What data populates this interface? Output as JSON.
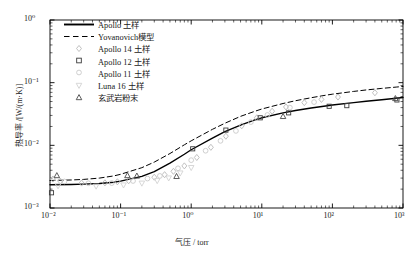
{
  "chart_data": {
    "type": "line",
    "title": "",
    "subtitle": "",
    "xlabel": "气压 / torr",
    "ylabel": "热导率 /[W/(m·K)]",
    "xscale": "log",
    "yscale": "log",
    "xlim": [
      0.01,
      1000
    ],
    "ylim": [
      0.001,
      1
    ],
    "grid": false,
    "legend_position": "upper-left-inside",
    "xticklabels": [
      "10⁻²",
      "10⁻¹",
      "10⁰",
      "10¹",
      "10²",
      "10³"
    ],
    "xtickvalues": [
      0.01,
      0.1,
      1,
      10,
      100,
      1000
    ],
    "yticklabels": [
      "10⁰",
      "10⁻¹",
      "10⁻²",
      "10⁻³"
    ],
    "ytickvalues": [
      1,
      0.1,
      0.01,
      0.001
    ],
    "series": [
      {
        "name": "Apollo 土样",
        "kind": "line",
        "style": "solid",
        "color": "#000000",
        "marker": "none",
        "points": [
          [
            0.01,
            0.00235
          ],
          [
            0.02,
            0.00237
          ],
          [
            0.03,
            0.0024
          ],
          [
            0.05,
            0.00246
          ],
          [
            0.08,
            0.00258
          ],
          [
            0.1,
            0.00268
          ],
          [
            0.2,
            0.0032
          ],
          [
            0.3,
            0.0038
          ],
          [
            0.5,
            0.0052
          ],
          [
            0.8,
            0.0072
          ],
          [
            1.0,
            0.0085
          ],
          [
            2.0,
            0.013
          ],
          [
            3.0,
            0.0165
          ],
          [
            5.0,
            0.021
          ],
          [
            8.0,
            0.0255
          ],
          [
            10.0,
            0.0275
          ],
          [
            20.0,
            0.033
          ],
          [
            30.0,
            0.036
          ],
          [
            50.0,
            0.0395
          ],
          [
            80.0,
            0.0425
          ],
          [
            100.0,
            0.044
          ],
          [
            200.0,
            0.048
          ],
          [
            300.0,
            0.0505
          ],
          [
            500.0,
            0.0535
          ],
          [
            800.0,
            0.0565
          ],
          [
            1000.0,
            0.058
          ]
        ]
      },
      {
        "name": "Yovanovich模型",
        "kind": "line",
        "style": "dashed",
        "color": "#000000",
        "marker": "none",
        "points": [
          [
            0.01,
            0.00275
          ],
          [
            0.02,
            0.0028
          ],
          [
            0.03,
            0.00286
          ],
          [
            0.05,
            0.003
          ],
          [
            0.08,
            0.00325
          ],
          [
            0.1,
            0.00345
          ],
          [
            0.2,
            0.0044
          ],
          [
            0.3,
            0.0054
          ],
          [
            0.5,
            0.0074
          ],
          [
            0.8,
            0.0102
          ],
          [
            1.0,
            0.0118
          ],
          [
            2.0,
            0.018
          ],
          [
            3.0,
            0.0225
          ],
          [
            5.0,
            0.029
          ],
          [
            8.0,
            0.035
          ],
          [
            10.0,
            0.038
          ],
          [
            20.0,
            0.0465
          ],
          [
            30.0,
            0.0515
          ],
          [
            50.0,
            0.0575
          ],
          [
            80.0,
            0.063
          ],
          [
            100.0,
            0.0655
          ],
          [
            200.0,
            0.0725
          ],
          [
            300.0,
            0.0765
          ],
          [
            500.0,
            0.081
          ],
          [
            800.0,
            0.085
          ],
          [
            1000.0,
            0.087
          ]
        ]
      },
      {
        "name": "Apollo 14 土样",
        "kind": "scatter",
        "style": "none",
        "color": "#b9b9b9",
        "marker": "diamond",
        "points": [
          [
            0.011,
            0.0029
          ],
          [
            0.014,
            0.00268
          ],
          [
            0.028,
            0.0025
          ],
          [
            0.06,
            0.00252
          ],
          [
            0.09,
            0.00262
          ],
          [
            0.13,
            0.00272
          ],
          [
            0.3,
            0.0031
          ],
          [
            0.42,
            0.0034
          ],
          [
            0.56,
            0.00385
          ],
          [
            0.8,
            0.0047
          ],
          [
            1.2,
            0.0064
          ],
          [
            1.9,
            0.0093
          ],
          [
            3.1,
            0.014
          ],
          [
            5.2,
            0.0205
          ],
          [
            8.5,
            0.0275
          ],
          [
            14.0,
            0.035
          ],
          [
            22.0,
            0.041
          ],
          [
            40.0,
            0.048
          ],
          [
            70.0,
            0.054
          ],
          [
            120.0,
            0.059
          ],
          [
            400.0,
            0.069
          ]
        ]
      },
      {
        "name": "Apollo 12 土样",
        "kind": "scatter",
        "style": "none",
        "color": "#3c3c3c",
        "marker": "square",
        "points": [
          [
            0.0105,
            0.00175
          ],
          [
            1.05,
            0.0088
          ],
          [
            3.1,
            0.0175
          ],
          [
            9.5,
            0.0275
          ],
          [
            24.0,
            0.033
          ],
          [
            90.0,
            0.042
          ],
          [
            160.0,
            0.043
          ],
          [
            820.0,
            0.053
          ]
        ]
      },
      {
        "name": "Apollo 11 土样",
        "kind": "scatter",
        "style": "none",
        "color": "#c9c9c9",
        "marker": "circle",
        "points": [
          [
            0.016,
            0.00265
          ],
          [
            0.035,
            0.00248
          ],
          [
            0.075,
            0.0025
          ],
          [
            0.15,
            0.0027
          ],
          [
            0.24,
            0.00295
          ],
          [
            0.36,
            0.00325
          ],
          [
            0.65,
            0.0043
          ],
          [
            1.0,
            0.0058
          ],
          [
            1.6,
            0.0082
          ],
          [
            2.6,
            0.0118
          ],
          [
            4.3,
            0.017
          ],
          [
            7.0,
            0.0235
          ],
          [
            12.0,
            0.0305
          ],
          [
            25.0,
            0.04
          ],
          [
            55.0,
            0.049
          ]
        ]
      },
      {
        "name": "Luna 16 土样",
        "kind": "scatter",
        "style": "none",
        "color": "#d2d2d2",
        "marker": "triangle-down",
        "points": [
          [
            0.013,
            0.00225
          ],
          [
            0.045,
            0.00222
          ],
          [
            0.11,
            0.00232
          ],
          [
            0.2,
            0.00248
          ],
          [
            0.33,
            0.00272
          ],
          [
            0.48,
            0.003
          ],
          [
            0.7,
            0.0036
          ],
          [
            1.0,
            0.0044
          ]
        ]
      },
      {
        "name": "玄武岩粉末",
        "kind": "scatter",
        "style": "none",
        "color": "#4a4a4a",
        "marker": "triangle-up",
        "points": [
          [
            0.0125,
            0.0033
          ],
          [
            0.125,
            0.0033
          ],
          [
            0.17,
            0.00325
          ],
          [
            0.62,
            0.0032
          ],
          [
            20.0,
            0.029
          ],
          [
            780.0,
            0.056
          ]
        ]
      }
    ]
  },
  "axes": {
    "x_ticks": [
      {
        "label": "10⁻²"
      },
      {
        "label": "10⁻¹"
      },
      {
        "label": "10⁰"
      },
      {
        "label": "10¹"
      },
      {
        "label": "10²"
      },
      {
        "label": "10³"
      }
    ],
    "y_ticks": [
      {
        "label": "10⁰"
      },
      {
        "label": "10⁻¹"
      },
      {
        "label": "10⁻²"
      },
      {
        "label": "10⁻³"
      }
    ],
    "xlabel": "气压 / torr",
    "ylabel": "热导率 /[W/(m·K)]"
  },
  "legend": {
    "items": [
      {
        "label": "Apollo 土样",
        "key": "solid-line-key",
        "color": "#000000"
      },
      {
        "label": "Yovanovich模型",
        "key": "dashed-line-key",
        "color": "#000000"
      },
      {
        "label": "Apollo 14 土样",
        "key": "diamond-marker-key",
        "color": "#b9b9b9"
      },
      {
        "label": "Apollo 12 土样",
        "key": "square-marker-key",
        "color": "#3c3c3c"
      },
      {
        "label": "Apollo 11 土样",
        "key": "circle-marker-key",
        "color": "#c9c9c9"
      },
      {
        "label": "Luna 16 土样",
        "key": "triangle-down-marker-key",
        "color": "#d2d2d2"
      },
      {
        "label": "玄武岩粉末",
        "key": "triangle-up-marker-key",
        "color": "#4a4a4a"
      }
    ]
  }
}
